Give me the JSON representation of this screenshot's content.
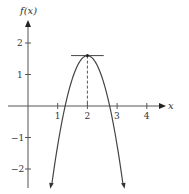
{
  "chart_data": {
    "type": "line",
    "title": "",
    "xlabel": "x",
    "ylabel": "f(x)",
    "xlim": [
      -0.6,
      4.6
    ],
    "ylim": [
      -2.6,
      2.6
    ],
    "x_ticks": [
      1,
      2,
      3,
      4
    ],
    "y_ticks": [
      2,
      1,
      -1,
      -2
    ],
    "x_tick_labels": [
      "1",
      "2",
      "3",
      "4"
    ],
    "y_tick_labels": [
      "2",
      "1",
      "−1",
      "−2"
    ],
    "grid": false,
    "series": [
      {
        "name": "f(x)",
        "function": "downward parabola with maximum at x = 2",
        "x": [
          0.8,
          1.0,
          1.25,
          1.5,
          1.75,
          2.0,
          2.25,
          2.5,
          2.75,
          3.0,
          3.2
        ],
        "values": [
          -2.5,
          -1.25,
          0.0,
          0.89,
          1.42,
          1.6,
          1.42,
          0.89,
          0.0,
          -1.25,
          -2.5
        ]
      }
    ],
    "annotations": [
      {
        "type": "horizontal-tangent-line",
        "at_x": 2,
        "y": 1.6,
        "x_range": [
          1.45,
          2.55
        ]
      },
      {
        "type": "dashed-vertical-line",
        "x": 2,
        "from_y": 0,
        "to_y": 1.6
      },
      {
        "type": "point",
        "x": 2,
        "y": 1.6,
        "label": "maximum"
      }
    ],
    "colors": {
      "curve": "#444444",
      "axes": "#555555",
      "tangent": "#444444"
    }
  }
}
